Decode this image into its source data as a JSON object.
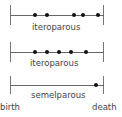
{
  "diagram": {
    "rows": [
      {
        "label": "iteroparous",
        "y": 15,
        "dots": [
          35,
          47,
          74,
          83,
          98
        ]
      },
      {
        "label": "iteroparous",
        "y": 52,
        "dots": [
          35,
          47,
          59,
          71,
          86
        ]
      },
      {
        "label": "semelparous",
        "y": 85,
        "dots": [
          96
        ]
      }
    ],
    "axis": {
      "start_label": "birth",
      "end_label": "death",
      "x_start": 10,
      "x_end": 103
    },
    "colors": {
      "line": "#666666",
      "dot": "#111111",
      "text": "#444444"
    }
  }
}
